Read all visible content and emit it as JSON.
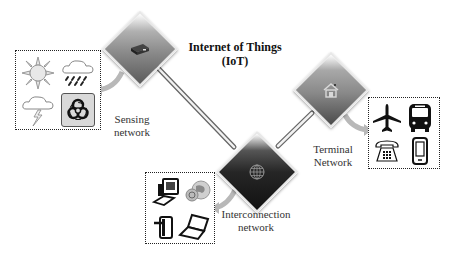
{
  "title": {
    "line1": "Internet of Things",
    "line2": "(IoT)"
  },
  "nodes": {
    "sensing": {
      "label_line1": "Sensing",
      "label_line2": "network",
      "diamond_icon": "device-icon",
      "items": [
        "sun-icon",
        "rain-cloud-icon",
        "lightning-cloud-icon",
        "biohazard-icon"
      ]
    },
    "terminal": {
      "label_line1": "Terminal",
      "label_line2": "Network",
      "diamond_icon": "home-icon",
      "items": [
        "airplane-icon",
        "bus-icon",
        "telephone-icon",
        "mobile-phone-icon"
      ]
    },
    "interconnection": {
      "label_line1": "Interconnection",
      "label_line2": "network",
      "diamond_icon": "globe-icon",
      "items": [
        "desktop-computer-icon",
        "internet-globe-icon",
        "tablet-icon",
        "laptop-icon"
      ]
    }
  },
  "colors": {
    "background": "#ffffff",
    "diamond_light": "#8a8a8a",
    "diamond_dark": "#1a1a1a",
    "connector": "#888888",
    "arrow": "#b5b5b5",
    "text": "#222222"
  }
}
